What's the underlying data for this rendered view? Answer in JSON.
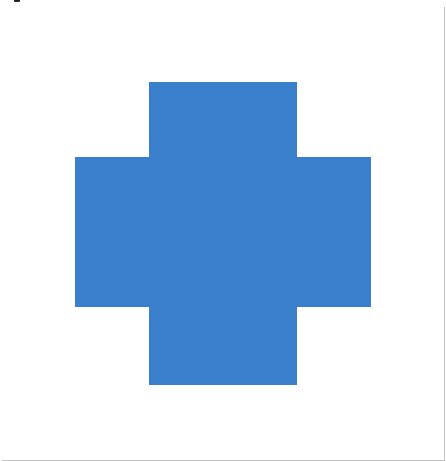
{
  "figure": {
    "caption_cutoff": "",
    "rows": 6,
    "cols": 6,
    "col_edges": [
      2,
      75,
      149,
      223,
      297,
      371,
      444
    ],
    "row_edges": [
      7,
      82,
      157,
      232,
      307,
      385,
      460
    ],
    "fill_color": "#3a7fcb",
    "empty_color": "#ffffff",
    "grid_line_color": "#c4c4c4",
    "filled_cells": [
      [
        1,
        2
      ],
      [
        1,
        3
      ],
      [
        2,
        1
      ],
      [
        2,
        2
      ],
      [
        2,
        3
      ],
      [
        2,
        4
      ],
      [
        3,
        1
      ],
      [
        3,
        2
      ],
      [
        3,
        3
      ],
      [
        3,
        4
      ],
      [
        4,
        2
      ],
      [
        4,
        3
      ]
    ]
  }
}
